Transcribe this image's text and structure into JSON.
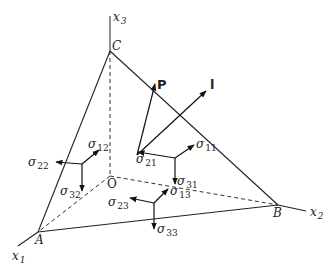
{
  "diagram": {
    "axes": {
      "x1": {
        "base": "x",
        "sub": "1"
      },
      "x2": {
        "base": "x",
        "sub": "2"
      },
      "x3": {
        "base": "x",
        "sub": "3"
      }
    },
    "points": {
      "A": "A",
      "B": "B",
      "C": "C",
      "O": "O"
    },
    "vectors": {
      "P": "P",
      "l": "l"
    },
    "stresses": {
      "s11": {
        "sym": "σ",
        "sub": "11"
      },
      "s12": {
        "sym": "σ",
        "sub": "12"
      },
      "s13": {
        "sym": "σ",
        "sub": "13"
      },
      "s21": {
        "sym": "σ",
        "sub": "21"
      },
      "s22": {
        "sym": "σ",
        "sub": "22"
      },
      "s23": {
        "sym": "σ",
        "sub": "23"
      },
      "s31": {
        "sym": "σ",
        "sub": "31"
      },
      "s32": {
        "sym": "σ",
        "sub": "32"
      },
      "s33": {
        "sym": "σ",
        "sub": "33"
      }
    },
    "colors": {
      "line": "#222222",
      "axis": "#555555",
      "background": "#ffffff"
    }
  }
}
